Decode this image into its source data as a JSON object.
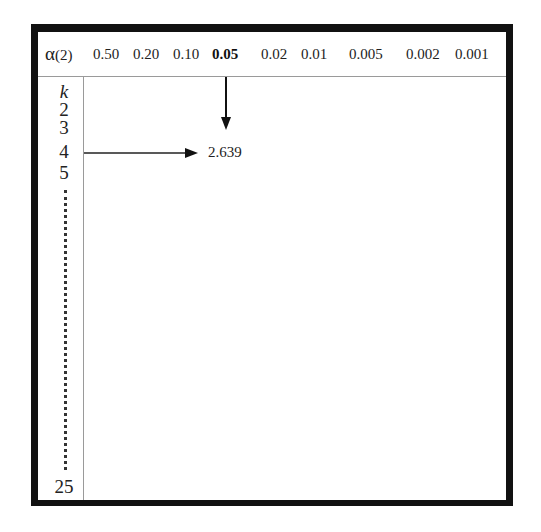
{
  "table": {
    "header": {
      "alpha_symbol": "α",
      "alpha_suffix": "(2)",
      "columns": [
        {
          "label": "0.50",
          "bold": false
        },
        {
          "label": "0.20",
          "bold": false
        },
        {
          "label": "0.10",
          "bold": false
        },
        {
          "label": "0.05",
          "bold": true
        },
        {
          "label": "0.02",
          "bold": false
        },
        {
          "label": "0.01",
          "bold": false
        },
        {
          "label": "0.005",
          "bold": false
        },
        {
          "label": "0.002",
          "bold": false
        },
        {
          "label": "0.001",
          "bold": false
        }
      ]
    },
    "rows": {
      "header_label": "k",
      "labels": [
        "2",
        "3",
        "4",
        "5"
      ],
      "last_label": "25"
    },
    "highlight": {
      "column": "0.05",
      "row": "4",
      "value": "2.639"
    }
  },
  "colors": {
    "frame": "#111111",
    "rules": "#9a9a9a",
    "text": "#222222"
  }
}
